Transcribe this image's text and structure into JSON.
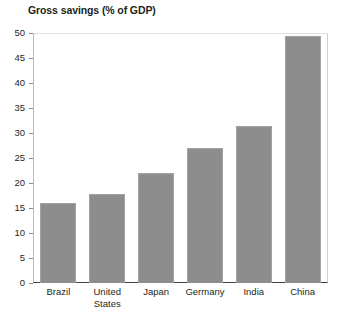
{
  "chart_data": {
    "type": "bar",
    "title": "Gross savings (% of GDP)",
    "xlabel": "",
    "ylabel": "",
    "categories": [
      "Brazil",
      "United States",
      "Japan",
      "Germany",
      "India",
      "China"
    ],
    "values": [
      16.0,
      17.9,
      22.0,
      27.0,
      31.4,
      49.4
    ],
    "ylim": [
      0,
      50
    ],
    "yticks": [
      0,
      5,
      10,
      15,
      20,
      25,
      30,
      35,
      40,
      45,
      50
    ],
    "ytick_labels": [
      "0",
      "5",
      "10",
      "15",
      "20",
      "25",
      "30",
      "35",
      "40",
      "45",
      "50"
    ],
    "grid": false,
    "legend": null,
    "bar_color": "#8d8d8d",
    "axis_color": "#3f3f3f"
  },
  "category_label_lines": [
    [
      "Brazil"
    ],
    [
      "United",
      "States"
    ],
    [
      "Japan"
    ],
    [
      "Germany"
    ],
    [
      "India"
    ],
    [
      "China"
    ]
  ]
}
